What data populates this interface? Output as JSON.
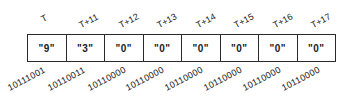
{
  "diagram": {
    "cells": [
      {
        "time": "T",
        "char": "\"9\"",
        "bits": "10111001"
      },
      {
        "time": "T+11",
        "char": "\"3\"",
        "bits": "10110011"
      },
      {
        "time": "T+12",
        "char": "\"0\"",
        "bits": "10110000"
      },
      {
        "time": "T+13",
        "char": "\"0\"",
        "bits": "10110000"
      },
      {
        "time": "T+14",
        "char": "\"0\"",
        "bits": "10110000"
      },
      {
        "time": "T+15",
        "char": "\"0\"",
        "bits": "10110000"
      },
      {
        "time": "T+16",
        "char": "\"0\"",
        "bits": "10110000"
      },
      {
        "time": "T+17",
        "char": "\"0\"",
        "bits": "10110000"
      }
    ],
    "colors": {
      "line": "#2a2a2a",
      "text": "#1a1a1a",
      "background": "#ffffff"
    }
  }
}
